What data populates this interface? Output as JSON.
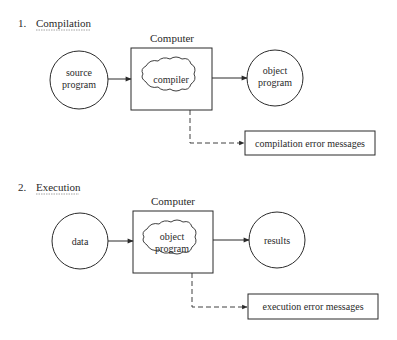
{
  "sections": [
    {
      "number": "1.",
      "title": "Compilation",
      "computer_label": "Computer",
      "input": [
        "source",
        "program"
      ],
      "processor": [
        "compiler"
      ],
      "output": [
        "object",
        "program"
      ],
      "error_box": "compilation error messages"
    },
    {
      "number": "2.",
      "title": "Execution",
      "computer_label": "Computer",
      "input": [
        "data"
      ],
      "processor": [
        "object",
        "program"
      ],
      "output": [
        "results"
      ],
      "error_box": "execution error messages"
    }
  ],
  "colors": {
    "ink": "#2a2a2a",
    "background": "#ffffff"
  }
}
